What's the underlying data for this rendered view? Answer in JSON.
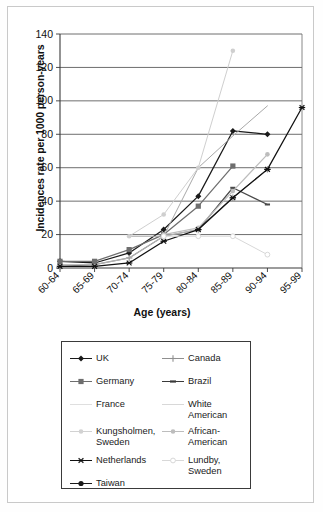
{
  "chart_data": {
    "type": "line",
    "title": "",
    "xlabel": "Age (years)",
    "ylabel": "Incidences rate per 1000 person-years",
    "categories": [
      "60-64",
      "65-69",
      "70-74",
      "75-79",
      "80-84",
      "85-89",
      "90-94",
      "95-99"
    ],
    "ylim": [
      0,
      140
    ],
    "yticks": [
      0,
      20,
      40,
      60,
      80,
      100,
      120,
      140
    ],
    "grid": "horizontal",
    "legend_position": "below-plot",
    "series": [
      {
        "name": "UK",
        "marker": "diamond",
        "color": "#1a1a1a",
        "values": [
          4,
          3,
          9,
          23,
          43,
          82,
          80,
          null
        ]
      },
      {
        "name": "Canada",
        "marker": "plus",
        "color": "#8f8f8f",
        "values": [
          1,
          2,
          6,
          19,
          23,
          42,
          59,
          null
        ]
      },
      {
        "name": "Germany",
        "marker": "square",
        "color": "#6e6e6e",
        "values": [
          4,
          4,
          11,
          20,
          37,
          61,
          null,
          null
        ]
      },
      {
        "name": "Brazil",
        "marker": "dash",
        "color": "#4a4a4a",
        "values": [
          null,
          null,
          null,
          null,
          23,
          48,
          38,
          null
        ]
      },
      {
        "name": "France",
        "marker": "none",
        "color": "#b4b4b4",
        "values": [
          2,
          2,
          6,
          19,
          23,
          null,
          null,
          null
        ]
      },
      {
        "name": "White American",
        "marker": "none",
        "color": "#a8a8a8",
        "values": [
          null,
          null,
          19,
          19,
          60,
          79,
          97,
          null
        ]
      },
      {
        "name": "Kungsholmen, Sweden",
        "marker": "dot-light",
        "color": "#cfcfcf",
        "values": [
          null,
          null,
          19,
          32,
          60,
          130,
          null,
          null
        ]
      },
      {
        "name": "African-American",
        "marker": "dot-mid",
        "color": "#bdbdbd",
        "values": [
          null,
          null,
          null,
          20,
          24,
          46,
          68,
          null
        ]
      },
      {
        "name": "Netherlands",
        "marker": "asterisk",
        "color": "#111111",
        "values": [
          1,
          1,
          3,
          16,
          23,
          42,
          59,
          96
        ]
      },
      {
        "name": "Lundby, Sweden",
        "marker": "open-circle",
        "color": "#d8d8d8",
        "values": [
          null,
          null,
          null,
          19,
          19,
          19,
          8,
          null
        ]
      },
      {
        "name": "Taiwan",
        "marker": "circle",
        "color": "#1a1a1a",
        "values": [
          null,
          null,
          null,
          null,
          null,
          null,
          null,
          null
        ]
      }
    ]
  },
  "legend": {
    "items": [
      {
        "label": "UK",
        "marker": "diamond",
        "color": "#1a1a1a",
        "col": 0,
        "row": 0
      },
      {
        "label": "Canada",
        "marker": "plus",
        "color": "#8f8f8f",
        "col": 1,
        "row": 0
      },
      {
        "label": "Germany",
        "marker": "square",
        "color": "#6e6e6e",
        "col": 0,
        "row": 1
      },
      {
        "label": "Brazil",
        "marker": "dash",
        "color": "#3a3a3a",
        "col": 1,
        "row": 1
      },
      {
        "label": "France",
        "marker": "none",
        "color": "#c4c4c4",
        "col": 0,
        "row": 2
      },
      {
        "label": "White\nAmerican",
        "marker": "none",
        "color": "#b8b8b8",
        "col": 1,
        "row": 2
      },
      {
        "label": "Kungsholmen,\nSweden",
        "marker": "dot-light",
        "color": "#d2d2d2",
        "col": 0,
        "row": 3
      },
      {
        "label": "African-\nAmerican",
        "marker": "dot-mid",
        "color": "#bdbdbd",
        "col": 1,
        "row": 3
      },
      {
        "label": "Netherlands",
        "marker": "asterisk",
        "color": "#111111",
        "col": 0,
        "row": 4
      },
      {
        "label": "Lundby,\nSweden",
        "marker": "open-circle",
        "color": "#d8d8d8",
        "col": 1,
        "row": 4
      },
      {
        "label": "Taiwan",
        "marker": "circle",
        "color": "#1a1a1a",
        "col": 0,
        "row": 5
      }
    ]
  },
  "axis": {
    "y_title": "Incidences rate per 1000 person-years",
    "x_title": "Age (years)"
  }
}
